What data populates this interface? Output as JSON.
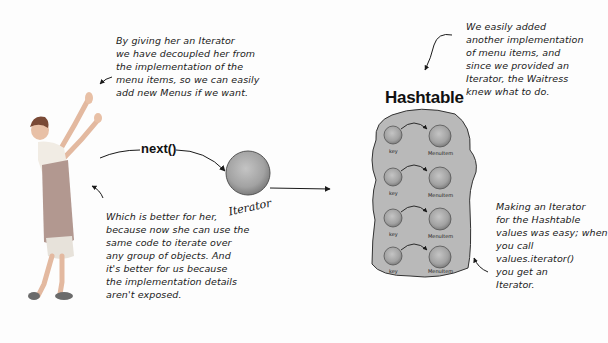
{
  "diagram": {
    "hashtable_title": "Hashtable",
    "method_label": "next()",
    "iterator_label": "Iterator",
    "entries": [
      {
        "key_label": "key",
        "value_label": "MenuItem"
      },
      {
        "key_label": "key",
        "value_label": "MenuItem"
      },
      {
        "key_label": "key",
        "value_label": "MenuItem"
      },
      {
        "key_label": "key",
        "value_label": "MenuItem"
      }
    ]
  },
  "notes": {
    "top_left": [
      "By giving her an Iterator",
      "we have decoupled her from",
      "the implementation of the",
      "menu items, so we can easily",
      "add new Menus if we want."
    ],
    "bottom_left": [
      "Which is better for her,",
      "because now she can use the",
      "same code to iterate over",
      "any group of objects.  And",
      "it's better for us because",
      "the implementation details",
      "aren't exposed."
    ],
    "top_right": [
      "We easily added",
      "another implementation",
      "of menu items, and",
      "since we provided an",
      "Iterator, the Waitress",
      "knew what to do."
    ],
    "bottom_right": [
      "Making an Iterator",
      "for the Hashtable",
      "values was easy; when",
      "you call",
      "values.iterator()",
      "you get an",
      "Iterator."
    ]
  },
  "colors": {
    "blob_fill": "#b9b9b9",
    "circle_fill": "#a9a9a9",
    "ink": "#1a1a1a"
  }
}
